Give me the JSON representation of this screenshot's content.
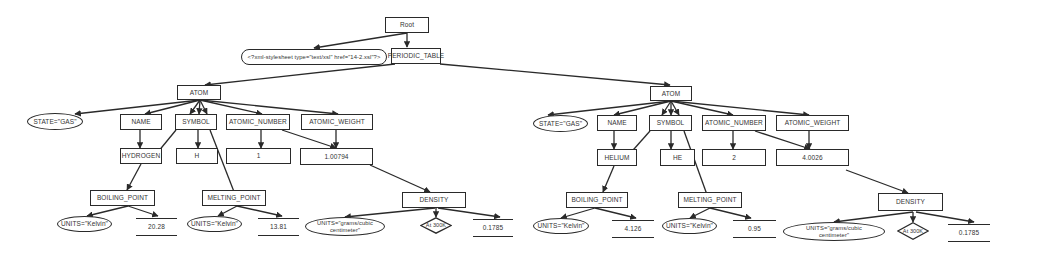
{
  "diagram": {
    "type": "xml-tree",
    "root": {
      "label": "Root"
    },
    "stylesheet": {
      "label": "<?xml-stylesheet type=\"text/xsl\" href=\"14-2.xsl\"?>"
    },
    "periodic_table": {
      "label": "PERIODIC_TABLE"
    },
    "atoms": [
      {
        "label": "ATOM",
        "state": "STATE=\"GAS\"",
        "name": {
          "label": "NAME",
          "value": "HYDROGEN"
        },
        "symbol": {
          "label": "SYMBOL",
          "value": "H"
        },
        "atomic_number": {
          "label": "ATOMIC_NUMBER",
          "value": "1"
        },
        "atomic_weight": {
          "label": "ATOMIC_WEIGHT",
          "value": "1.00794"
        },
        "boiling_point": {
          "label": "BOILING_POINT",
          "units": "UNITS=\"Kelvin\"",
          "value": "20.28"
        },
        "melting_point": {
          "label": "MELTING_POINT",
          "units": "UNITS=\"Kelvin\"",
          "value": "13.81"
        },
        "density": {
          "label": "DENSITY",
          "units": "UNITS=\"grams/cubic centimeter\"",
          "condition": "At 300K",
          "value": "0.1785"
        }
      },
      {
        "label": "ATOM",
        "state": "STATE=\"GAS\"",
        "name": {
          "label": "NAME",
          "value": "HELIUM"
        },
        "symbol": {
          "label": "SYMBOL",
          "value": "HE"
        },
        "atomic_number": {
          "label": "ATOMIC_NUMBER",
          "value": "2"
        },
        "atomic_weight": {
          "label": "ATOMIC_WEIGHT",
          "value": "4.0026"
        },
        "boiling_point": {
          "label": "BOILING_POINT",
          "units": "UNITS=\"Kelvin\"",
          "value": "4.126"
        },
        "melting_point": {
          "label": "MELTING_POINT",
          "units": "UNITS=\"Kelvin\"",
          "value": "0.95"
        },
        "density": {
          "label": "DENSITY",
          "units": "UNITS=\"grams/cubic centimeter\"",
          "condition": "At 300K",
          "value": "0.1785"
        }
      }
    ]
  },
  "colors": {
    "line": "#2a2a2a",
    "background": "#ffffff"
  }
}
